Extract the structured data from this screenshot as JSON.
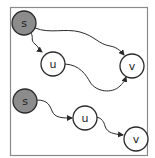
{
  "diagram": {
    "colors": {
      "source_fill": "#8c8c8c",
      "node_fill": "#ffffff",
      "stroke": "#2a2a2a",
      "frame": "#8a8a8a"
    },
    "graphs": [
      {
        "nodes": [
          {
            "id": "s",
            "label": "s",
            "cx": 24,
            "cy": 23,
            "r": 12,
            "source": true
          },
          {
            "id": "u",
            "label": "u",
            "cx": 53,
            "cy": 64,
            "r": 12,
            "source": false
          },
          {
            "id": "v",
            "label": "v",
            "cx": 132,
            "cy": 66,
            "r": 12,
            "source": false
          }
        ],
        "edges": [
          {
            "from": "s",
            "to": "u"
          },
          {
            "from": "s",
            "to": "v"
          },
          {
            "from": "u",
            "to": "v"
          }
        ]
      },
      {
        "nodes": [
          {
            "id": "s",
            "label": "s",
            "cx": 25,
            "cy": 101,
            "r": 12,
            "source": true
          },
          {
            "id": "u",
            "label": "u",
            "cx": 85,
            "cy": 118,
            "r": 12,
            "source": false
          },
          {
            "id": "v",
            "label": "v",
            "cx": 136,
            "cy": 139,
            "r": 12,
            "source": false
          }
        ],
        "edges": [
          {
            "from": "s",
            "to": "u"
          },
          {
            "from": "u",
            "to": "v"
          }
        ]
      }
    ]
  }
}
